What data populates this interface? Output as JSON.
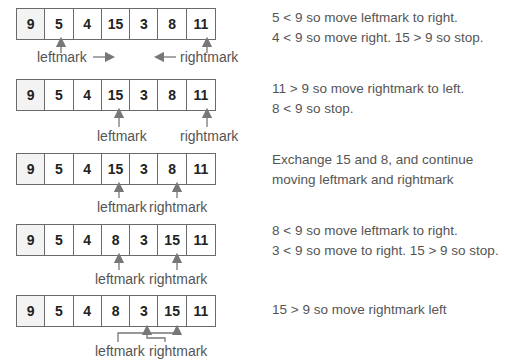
{
  "colors": {
    "text": "#555555",
    "line": "#777777",
    "border": "#6a6a6a",
    "pivot_bg": "#f3f3f3"
  },
  "steps": [
    {
      "array": [
        "9",
        "5",
        "4",
        "15",
        "3",
        "8",
        "11"
      ],
      "left_label": "leftmark",
      "right_label": "rightmark",
      "note": [
        "5 < 9 so move leftmark to right.",
        "4 < 9 so move right. 15 > 9 so stop."
      ]
    },
    {
      "array": [
        "9",
        "5",
        "4",
        "15",
        "3",
        "8",
        "11"
      ],
      "left_label": "leftmark",
      "right_label": "rightmark",
      "note": [
        "11 > 9 so move rightmark to left.",
        "8 < 9 so stop."
      ]
    },
    {
      "array": [
        "9",
        "5",
        "4",
        "15",
        "3",
        "8",
        "11"
      ],
      "left_label": "leftmark",
      "right_label": "rightmark",
      "note": [
        "Exchange 15 and 8, and continue",
        "moving leftmark and rightmark"
      ]
    },
    {
      "array": [
        "9",
        "5",
        "4",
        "8",
        "3",
        "15",
        "11"
      ],
      "left_label": "leftmark",
      "right_label": "rightmark",
      "note": [
        "8 < 9 so move leftmark to right.",
        "3 < 9  so move to right.  15 > 9 so stop."
      ]
    },
    {
      "array": [
        "9",
        "5",
        "4",
        "8",
        "3",
        "15",
        "11"
      ],
      "left_label": "leftmark",
      "right_label": "rightmark",
      "note": [
        "15 > 9 so move rightmark left"
      ]
    }
  ]
}
